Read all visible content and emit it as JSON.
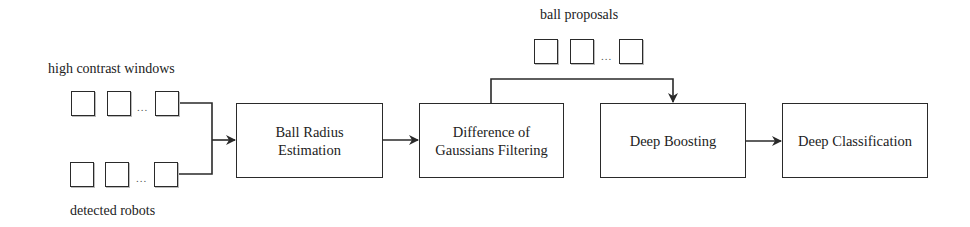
{
  "diagram": {
    "inputs": {
      "top_label": "high contrast windows",
      "bottom_label": "detected robots",
      "ellipsis": "..."
    },
    "proposals": {
      "label": "ball proposals",
      "ellipsis": "..."
    },
    "stages": [
      {
        "id": "ball-radius-estimation",
        "label_line1": "Ball Radius",
        "label_line2": "Estimation"
      },
      {
        "id": "difference-of-gaussians-filtering",
        "label_line1": "Difference of",
        "label_line2": "Gaussians Filtering"
      },
      {
        "id": "deep-boosting",
        "label_line1": "Deep Boosting",
        "label_line2": ""
      },
      {
        "id": "deep-classification",
        "label_line1": "Deep Classification",
        "label_line2": ""
      }
    ],
    "edges": [
      {
        "from": "high contrast windows",
        "to": "Ball Radius Estimation"
      },
      {
        "from": "detected robots",
        "to": "Ball Radius Estimation"
      },
      {
        "from": "Ball Radius Estimation",
        "to": "Difference of Gaussians Filtering"
      },
      {
        "from": "Difference of Gaussians Filtering",
        "to": "Deep Boosting",
        "via": "ball proposals"
      },
      {
        "from": "Deep Boosting",
        "to": "Deep Classification"
      }
    ],
    "colors": {
      "stroke": "#2a2a2a",
      "background": "#ffffff",
      "text": "#222222"
    }
  }
}
